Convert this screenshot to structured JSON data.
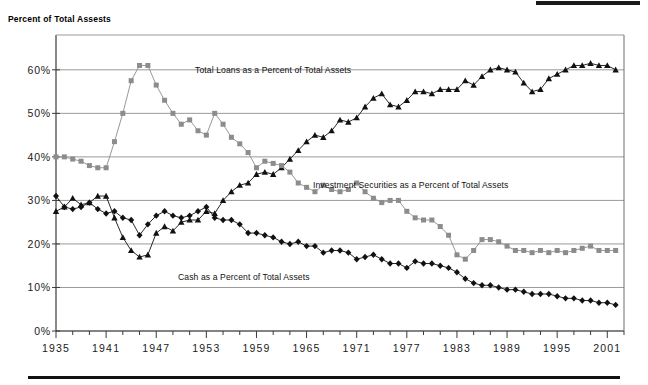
{
  "chart_data": {
    "type": "line",
    "title": "Percent of Total Assests",
    "xlabel": "",
    "ylabel": "",
    "ylim": [
      0,
      68
    ],
    "xlim": [
      1935,
      2003
    ],
    "grid": true,
    "legend_position": "inline-annotations",
    "ytick_labels": [
      "0%",
      "10%",
      "20%",
      "30%",
      "40%",
      "50%",
      "60%"
    ],
    "ytick_values": [
      0,
      10,
      20,
      30,
      40,
      50,
      60
    ],
    "xtick_labels": [
      "1935",
      "1941",
      "1947",
      "1953",
      "1959",
      "1965",
      "1971",
      "1977",
      "1983",
      "1989",
      "1995",
      "2001"
    ],
    "xtick_values": [
      1935,
      1941,
      1947,
      1953,
      1959,
      1965,
      1971,
      1977,
      1983,
      1989,
      1995,
      2001
    ],
    "x": [
      1935,
      1936,
      1937,
      1938,
      1939,
      1940,
      1941,
      1942,
      1943,
      1944,
      1945,
      1946,
      1947,
      1948,
      1949,
      1950,
      1951,
      1952,
      1953,
      1954,
      1955,
      1956,
      1957,
      1958,
      1959,
      1960,
      1961,
      1962,
      1963,
      1964,
      1965,
      1966,
      1967,
      1968,
      1969,
      1970,
      1971,
      1972,
      1973,
      1974,
      1975,
      1976,
      1977,
      1978,
      1979,
      1980,
      1981,
      1982,
      1983,
      1984,
      1985,
      1986,
      1987,
      1988,
      1989,
      1990,
      1991,
      1992,
      1993,
      1994,
      1995,
      1996,
      1997,
      1998,
      1999,
      2000,
      2001,
      2002
    ],
    "series": [
      {
        "name": "Total Loans as a Percent of Total Assets",
        "marker": "triangle",
        "color": "#111111",
        "values": [
          27.5,
          28.5,
          30.5,
          29.0,
          29.5,
          31.0,
          31.0,
          26.0,
          21.5,
          18.5,
          17.0,
          17.5,
          22.5,
          24.0,
          23.0,
          25.0,
          25.5,
          25.5,
          27.5,
          27.0,
          30.0,
          32.0,
          33.5,
          34.0,
          36.0,
          36.5,
          36.0,
          37.5,
          39.5,
          41.5,
          43.5,
          45.0,
          44.5,
          46.0,
          48.5,
          48.0,
          49.0,
          51.5,
          53.5,
          54.5,
          52.0,
          51.5,
          53.0,
          55.0,
          55.0,
          54.5,
          55.5,
          55.5,
          55.5,
          57.5,
          56.5,
          58.5,
          60.0,
          60.5,
          60.0,
          59.5,
          57.0,
          55.0,
          55.5,
          58.0,
          59.0,
          60.0,
          61.0,
          61.0,
          61.5,
          61.0,
          61.0,
          60.0
        ]
      },
      {
        "name": "Investment Securities as a Percent of Total Assets",
        "marker": "square",
        "color": "#8c8c8c",
        "values": [
          40.0,
          40.0,
          39.5,
          39.0,
          38.0,
          37.5,
          37.5,
          43.5,
          50.0,
          57.5,
          61.0,
          61.0,
          56.5,
          53.0,
          50.0,
          47.5,
          48.5,
          46.0,
          45.0,
          50.0,
          47.5,
          44.5,
          43.0,
          41.0,
          37.5,
          39.0,
          38.5,
          38.0,
          36.5,
          34.0,
          33.0,
          32.0,
          33.5,
          32.5,
          32.0,
          32.5,
          34.0,
          32.0,
          30.5,
          29.5,
          30.0,
          30.0,
          27.5,
          26.0,
          25.5,
          25.5,
          24.0,
          22.0,
          17.5,
          16.5,
          18.5,
          21.0,
          21.0,
          20.5,
          19.5,
          18.5,
          18.5,
          18.0,
          18.5,
          18.0,
          18.5,
          18.0,
          18.5,
          19.0,
          19.5,
          18.5,
          18.5,
          18.5
        ]
      },
      {
        "name": "Cash as a Percent of Total Assets",
        "marker": "diamond",
        "color": "#111111",
        "values": [
          31.0,
          28.5,
          28.0,
          28.5,
          29.5,
          28.0,
          27.0,
          27.5,
          26.0,
          25.5,
          22.0,
          24.5,
          26.5,
          27.5,
          26.5,
          26.0,
          26.5,
          27.5,
          28.5,
          26.0,
          25.5,
          25.5,
          24.5,
          22.5,
          22.5,
          22.0,
          21.5,
          20.5,
          20.0,
          20.5,
          19.5,
          19.5,
          18.0,
          18.5,
          18.5,
          18.0,
          16.5,
          17.0,
          17.5,
          16.5,
          15.5,
          15.5,
          14.5,
          16.0,
          15.5,
          15.5,
          15.0,
          14.5,
          13.5,
          12.0,
          11.0,
          10.5,
          10.5,
          10.0,
          9.5,
          9.5,
          9.0,
          8.5,
          8.5,
          8.5,
          8.0,
          7.5,
          7.5,
          7.0,
          7.0,
          6.5,
          6.5,
          6.0
        ]
      }
    ],
    "annotations": [
      {
        "id": "loans-label",
        "text": "Total Loans as a Percent of Total Assets",
        "x": 195,
        "y": 73
      },
      {
        "id": "securities-label",
        "text": "Investment Securities as a Percent of Total Assets",
        "x": 313,
        "y": 188
      },
      {
        "id": "cash-label",
        "text": "Cash as a Percent of Total Assets",
        "x": 178,
        "y": 280
      }
    ]
  },
  "colors": {
    "grid": "#9a9a9a",
    "axis": "#3b3b3b",
    "securities": "#8c8c8c",
    "loans": "#111111",
    "cash": "#111111",
    "rule": "#111111"
  }
}
